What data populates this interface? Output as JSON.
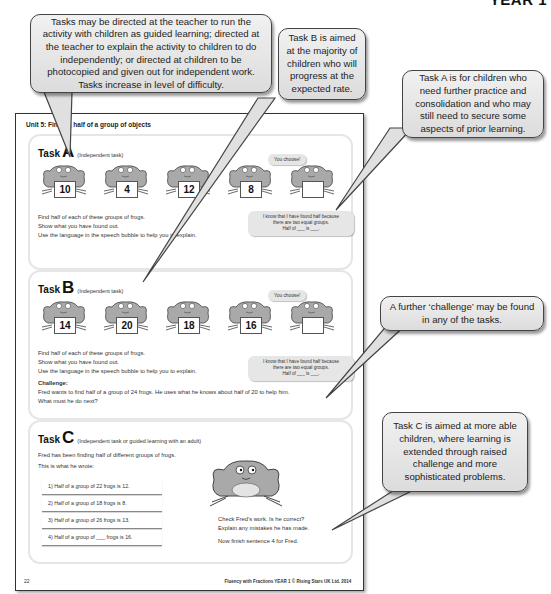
{
  "header": {
    "year_label": "YEAR 1"
  },
  "callouts": {
    "tasks_directed": "Tasks may be directed at the teacher to run the activity with children as guided learning; directed at the teacher to explain the activity to children to do independently; or directed at children to be photocopied and given out for independent work. Tasks increase in level of difficulty.",
    "task_b": "Task B is aimed at the majority of children who will progress at the expected rate.",
    "task_a": "Task A is for children who need further practice and consolidation and who may still need to secure some aspects of prior learning.",
    "challenge": "A further ‘challenge’ may be found in any of the tasks.",
    "task_c": "Task C is aimed at more able children, where learning is extended through raised challenge and more sophisticated problems."
  },
  "page": {
    "unit_title": "Unit 5: Finding half of a group of objects",
    "page_number": "22",
    "footer": "Fluency with Fractions YEAR 1 © Rising Stars UK Ltd. 2014"
  },
  "task_a": {
    "word": "Task",
    "letter": "A",
    "subtitle": "(Independent task)",
    "you_choose": "You choose!",
    "frogs": [
      "10",
      "4",
      "12",
      "8",
      ""
    ],
    "lines": [
      "Find half of each of these groups of frogs.",
      "Show what you have found out.",
      "Use the language in the speech bubble to help you to explain."
    ],
    "speech": [
      "I know that I have found half because",
      "there are two equal groups.",
      "Half of ___ is ___."
    ]
  },
  "task_b": {
    "word": "Task",
    "letter": "B",
    "subtitle": "(Independent task)",
    "you_choose": "You choose!",
    "frogs": [
      "14",
      "20",
      "18",
      "16",
      ""
    ],
    "lines": [
      "Find half of each of these groups of frogs.",
      "Show what you have found out.",
      "Use the language in the speech bubble to help you to explain."
    ],
    "speech": [
      "I know that I have found half because",
      "there are two equal groups.",
      "Half of ___ is ___."
    ],
    "challenge_label": "Challenge:",
    "challenge_lines": [
      "Fred wants to find half of a group of 24 frogs. He uses what he knows about half of 20 to help him.",
      "What must he do next?"
    ]
  },
  "task_c": {
    "word": "Task",
    "letter": "C",
    "subtitle": "(Independent task or guided learning with an adult)",
    "intro": "Fred has been finding half of different groups of frogs.",
    "intro2": "This is what he wrote:",
    "rows": [
      "1)  Half of a group of 22 frogs is 12.",
      "2)  Half of a group of 18 frogs is 8.",
      "3)  Half of a group of 26 frogs is 13.",
      "4)  Half of a group of ___ frogs is 16."
    ],
    "check_lines": [
      "Check Fred’s work. Is he correct?",
      "Explain any mistakes he has made."
    ],
    "finish": "Now finish sentence 4 for Fred."
  }
}
